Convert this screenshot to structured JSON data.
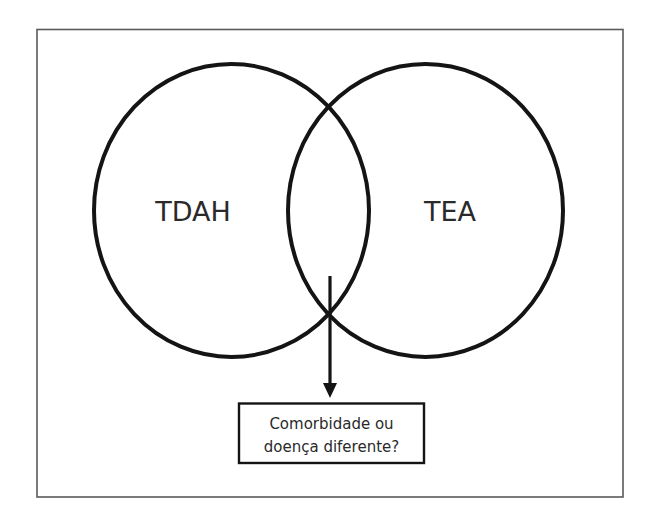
{
  "diagram": {
    "type": "venn",
    "sets": [
      {
        "id": "left",
        "label": "TDAH"
      },
      {
        "id": "right",
        "label": "TEA"
      }
    ],
    "intersection_callout": {
      "line1": "Comorbidade ou",
      "line2": "doença diferente?"
    },
    "colors": {
      "stroke": "#141414",
      "frame": "#5a5a5a",
      "text": "#2a2a2a",
      "background": "#ffffff"
    }
  }
}
